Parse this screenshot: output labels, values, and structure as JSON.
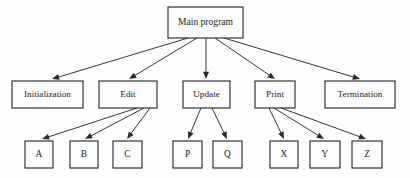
{
  "diagram": {
    "kind": "hierarchy-chart",
    "background_color": "#fefefe",
    "box_fill_color": "#fdfdfd",
    "line_color": "#2b2b2b",
    "text_color": "#1a1a1a",
    "levels": [
      {
        "level": 0,
        "nodes": [
          {
            "id": "main",
            "label": "Main program",
            "x": 168,
            "y": 7,
            "w": 75,
            "h": 31
          }
        ]
      },
      {
        "level": 1,
        "nodes": [
          {
            "id": "initialization",
            "label": "Initialization",
            "x": 12,
            "y": 81,
            "w": 71,
            "h": 27
          },
          {
            "id": "edit",
            "label": "Edit",
            "x": 99,
            "y": 81,
            "w": 58,
            "h": 27
          },
          {
            "id": "update",
            "label": "Update",
            "x": 183,
            "y": 81,
            "w": 47,
            "h": 27
          },
          {
            "id": "print",
            "label": "Print",
            "x": 255,
            "y": 81,
            "w": 40,
            "h": 27
          },
          {
            "id": "termination",
            "label": "Termination",
            "x": 325,
            "y": 81,
            "w": 70,
            "h": 27
          }
        ]
      },
      {
        "level": 2,
        "nodes": [
          {
            "id": "a",
            "label": "A",
            "x": 25,
            "y": 141,
            "w": 28,
            "h": 27
          },
          {
            "id": "b",
            "label": "B",
            "x": 70,
            "y": 141,
            "w": 28,
            "h": 27
          },
          {
            "id": "c",
            "label": "C",
            "x": 113,
            "y": 141,
            "w": 29,
            "h": 27
          },
          {
            "id": "p",
            "label": "P",
            "x": 173,
            "y": 141,
            "w": 29,
            "h": 27
          },
          {
            "id": "q",
            "label": "Q",
            "x": 213,
            "y": 141,
            "w": 29,
            "h": 27
          },
          {
            "id": "x",
            "label": "X",
            "x": 270,
            "y": 141,
            "w": 28,
            "h": 27
          },
          {
            "id": "y",
            "label": "Y",
            "x": 310,
            "y": 141,
            "w": 30,
            "h": 27
          },
          {
            "id": "z",
            "label": "Z",
            "x": 352,
            "y": 141,
            "w": 30,
            "h": 27
          }
        ]
      }
    ],
    "edges": [
      {
        "id": "main-initialization",
        "from": "main",
        "to": "initialization",
        "x1": 188,
        "y1": 38,
        "x2": 52,
        "y2": 79
      },
      {
        "id": "main-edit",
        "from": "main",
        "to": "edit",
        "x1": 197,
        "y1": 38,
        "x2": 129,
        "y2": 79
      },
      {
        "id": "main-update",
        "from": "main",
        "to": "update",
        "x1": 206,
        "y1": 38,
        "x2": 206,
        "y2": 79
      },
      {
        "id": "main-print",
        "from": "main",
        "to": "print",
        "x1": 215,
        "y1": 38,
        "x2": 275,
        "y2": 79
      },
      {
        "id": "main-termination",
        "from": "main",
        "to": "termination",
        "x1": 224,
        "y1": 38,
        "x2": 360,
        "y2": 79
      },
      {
        "id": "edit-a",
        "from": "edit",
        "to": "a",
        "x1": 137,
        "y1": 108,
        "x2": 42,
        "y2": 139
      },
      {
        "id": "edit-b",
        "from": "edit",
        "to": "b",
        "x1": 144,
        "y1": 108,
        "x2": 85,
        "y2": 139
      },
      {
        "id": "edit-c",
        "from": "edit",
        "to": "c",
        "x1": 150,
        "y1": 108,
        "x2": 127,
        "y2": 139
      },
      {
        "id": "update-p",
        "from": "update",
        "to": "p",
        "x1": 201,
        "y1": 108,
        "x2": 188,
        "y2": 139
      },
      {
        "id": "update-q",
        "from": "update",
        "to": "q",
        "x1": 212,
        "y1": 108,
        "x2": 227,
        "y2": 139
      },
      {
        "id": "print-x",
        "from": "print",
        "to": "x",
        "x1": 269,
        "y1": 108,
        "x2": 284,
        "y2": 139
      },
      {
        "id": "print-y",
        "from": "print",
        "to": "y",
        "x1": 274,
        "y1": 108,
        "x2": 324,
        "y2": 139
      },
      {
        "id": "print-z",
        "from": "print",
        "to": "z",
        "x1": 281,
        "y1": 108,
        "x2": 366,
        "y2": 139
      }
    ]
  }
}
